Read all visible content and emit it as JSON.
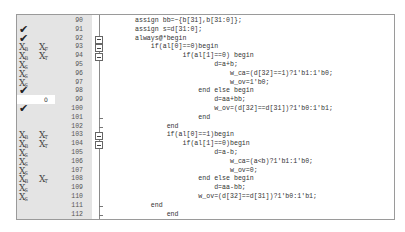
{
  "editor": {
    "lines": [
      {
        "num": "90",
        "cov1": "",
        "cov2": "",
        "hit": "",
        "fold": "none",
        "code": "assign bb=~{b[31],b[31:0]};"
      },
      {
        "num": "91",
        "cov1": "check",
        "cov2": "",
        "hit": "",
        "fold": "none",
        "code": "assign s=d[31:0];"
      },
      {
        "num": "92",
        "cov1": "check",
        "cov2": "",
        "hit": "",
        "fold": "box",
        "code": "always@*begin"
      },
      {
        "num": "93",
        "cov1": "X|B",
        "cov2": "X|F",
        "hit": "",
        "fold": "box",
        "code": "    if(al[0]==0)begin"
      },
      {
        "num": "94",
        "cov1": "X|B",
        "cov2": "X|T",
        "hit": "",
        "fold": "box",
        "code": "            if(al[1]==0) begin"
      },
      {
        "num": "95",
        "cov1": "X|S",
        "cov2": "",
        "hit": "",
        "fold": "none",
        "code": "                    d=a+b;"
      },
      {
        "num": "96",
        "cov1": "X|S",
        "cov2": "",
        "hit": "",
        "fold": "none",
        "code": "                        w_ca=(d[32]==1)?1'b1:1'b0;"
      },
      {
        "num": "97",
        "cov1": "X|S",
        "cov2": "",
        "hit": "",
        "fold": "none",
        "code": "                        w_ov=1'b0;"
      },
      {
        "num": "98",
        "cov1": "check",
        "cov2": "",
        "hit": "",
        "fold": "none",
        "code": "                end else begin"
      },
      {
        "num": "99",
        "cov1": "",
        "cov2": "",
        "hit": "0",
        "fold": "none",
        "code": "                    d=aa+bb;"
      },
      {
        "num": "100",
        "cov1": "check",
        "cov2": "",
        "hit": "",
        "fold": "none",
        "code": "                    w_ov=(d[32]==d[31])?1'b0:1'b1;"
      },
      {
        "num": "101",
        "cov1": "",
        "cov2": "",
        "hit": "",
        "fold": "tick",
        "code": "                end"
      },
      {
        "num": "102",
        "cov1": "",
        "cov2": "",
        "hit": "",
        "fold": "tick",
        "code": "        end"
      },
      {
        "num": "103",
        "cov1": "X|B",
        "cov2": "X|T",
        "hit": "",
        "fold": "box",
        "code": "        if(al[0]==1)begin"
      },
      {
        "num": "104",
        "cov1": "X|B",
        "cov2": "X|T",
        "hit": "",
        "fold": "box",
        "code": "            if(al[1]==0)begin"
      },
      {
        "num": "105",
        "cov1": "X|S",
        "cov2": "",
        "hit": "",
        "fold": "none",
        "code": "                    d=a-b;"
      },
      {
        "num": "106",
        "cov1": "X|S",
        "cov2": "",
        "hit": "",
        "fold": "none",
        "code": "                        w_ca=(a<b)?1'b1:1'b0;"
      },
      {
        "num": "107",
        "cov1": "X|S",
        "cov2": "",
        "hit": "",
        "fold": "none",
        "code": "                        w_ov=0;"
      },
      {
        "num": "108",
        "cov1": "X|B",
        "cov2": "X|T",
        "hit": "",
        "fold": "none",
        "code": "                end else begin"
      },
      {
        "num": "109",
        "cov1": "X|S",
        "cov2": "",
        "hit": "",
        "fold": "none",
        "code": "                    d=aa-bb;"
      },
      {
        "num": "110",
        "cov1": "X|S",
        "cov2": "",
        "hit": "",
        "fold": "none",
        "code": "                w_ov=(d[32]==d[31])?1'b0:1'b1;"
      },
      {
        "num": "111",
        "cov1": "",
        "cov2": "",
        "hit": "",
        "fold": "tick",
        "code": "    end"
      },
      {
        "num": "112",
        "cov1": "",
        "cov2": "",
        "hit": "",
        "fold": "tick",
        "code": "        end"
      }
    ]
  },
  "colors": {
    "gutter_bg": "#e4e4e4",
    "border": "#9a9a9a",
    "text": "#333333"
  }
}
